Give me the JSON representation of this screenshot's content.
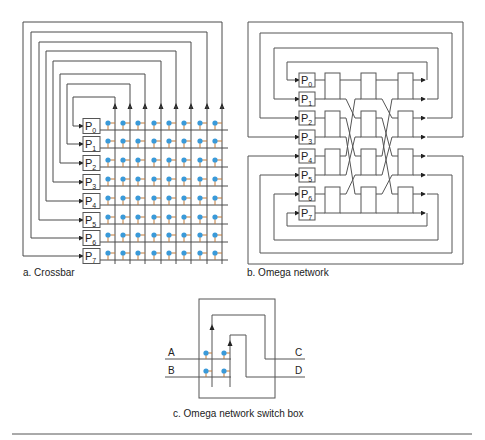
{
  "figure": {
    "panels": [
      {
        "id": "crossbar",
        "caption": "a. Crossbar",
        "processors": [
          "P0",
          "P1",
          "P2",
          "P3",
          "P4",
          "P5",
          "P6",
          "P7"
        ],
        "processor_labels": [
          {
            "base": "P",
            "sub": "0"
          },
          {
            "base": "P",
            "sub": "1"
          },
          {
            "base": "P",
            "sub": "2"
          },
          {
            "base": "P",
            "sub": "3"
          },
          {
            "base": "P",
            "sub": "4"
          },
          {
            "base": "P",
            "sub": "5"
          },
          {
            "base": "P",
            "sub": "6"
          },
          {
            "base": "P",
            "sub": "7"
          }
        ],
        "grid": {
          "rows": 8,
          "columns": 8,
          "crosspoint_color": "#3a9ad9"
        }
      },
      {
        "id": "omega",
        "caption": "b. Omega network",
        "processor_labels": [
          {
            "base": "P",
            "sub": "0"
          },
          {
            "base": "P",
            "sub": "1"
          },
          {
            "base": "P",
            "sub": "2"
          },
          {
            "base": "P",
            "sub": "3"
          },
          {
            "base": "P",
            "sub": "4"
          },
          {
            "base": "P",
            "sub": "5"
          },
          {
            "base": "P",
            "sub": "6"
          },
          {
            "base": "P",
            "sub": "7"
          }
        ],
        "stages": 3,
        "switches_per_stage": 4
      },
      {
        "id": "switch_box",
        "caption": "c. Omega network switch box",
        "inputs": [
          "A",
          "B"
        ],
        "outputs": [
          "C",
          "D"
        ],
        "crosspoint_color": "#3a9ad9"
      }
    ]
  }
}
